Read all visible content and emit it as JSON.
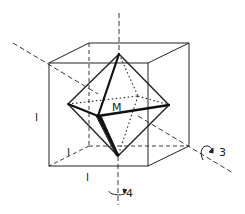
{
  "diagram": {
    "labels": {
      "center": "M",
      "edge_left": "l",
      "edge_depth": "l",
      "edge_bottom": "l",
      "axis_threefold": "3",
      "axis_fourfold": "4"
    },
    "colors": {
      "line": "#222222",
      "background": "#ffffff"
    },
    "cube": {
      "front_top_left": [
        49,
        63
      ],
      "front_top_right": [
        148,
        63
      ],
      "front_bottom_left": [
        49,
        166
      ],
      "front_bottom_right": [
        148,
        166
      ],
      "back_top_left": [
        89,
        43
      ],
      "back_top_right": [
        189,
        43
      ],
      "back_bottom_left": [
        89,
        146
      ],
      "back_bottom_right": [
        189,
        146
      ]
    },
    "octahedron": {
      "top": [
        119,
        54
      ],
      "bottom": [
        118,
        156
      ],
      "left": [
        68,
        104
      ],
      "right": [
        169,
        105
      ],
      "front": [
        98,
        116
      ],
      "back": [
        138,
        96
      ]
    }
  }
}
